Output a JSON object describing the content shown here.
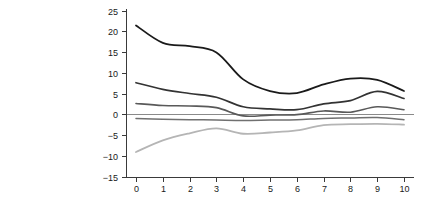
{
  "chart_data": {
    "type": "line",
    "title": "",
    "xlabel": "Number of years following portfolio formation",
    "ylabel": "ROIC − WACC (%)",
    "x": [
      0,
      1,
      2,
      3,
      4,
      5,
      6,
      7,
      8,
      9,
      10
    ],
    "xlim": [
      -0.55,
      10.6
    ],
    "ylim": [
      -15,
      25
    ],
    "xticks": [
      "0",
      "1",
      "2",
      "3",
      "4",
      "5",
      "6",
      "7",
      "8",
      "9",
      "10"
    ],
    "yticks": [
      "25",
      "20",
      "15",
      "10",
      "5",
      "0",
      "−5",
      "−10",
      "−15"
    ],
    "ytick_values": [
      25,
      20,
      15,
      10,
      5,
      0,
      -5,
      -10,
      -15
    ],
    "grid": false,
    "legend": "none",
    "reference_lines": [
      {
        "name": "zero-line",
        "y": 0,
        "color": "#8a8a8a"
      }
    ],
    "series": [
      {
        "name": "Top quintile",
        "color": "#1a1a1a",
        "width": 1.8,
        "values": [
          21.4,
          17.2,
          16.4,
          14.9,
          8.4,
          5.6,
          5.1,
          7.2,
          8.6,
          8.3,
          5.6
        ]
      },
      {
        "name": "Second quintile",
        "color": "#333333",
        "width": 1.7,
        "values": [
          7.6,
          6.0,
          5.0,
          4.1,
          1.8,
          1.3,
          1.1,
          2.5,
          3.3,
          5.5,
          3.8
        ]
      },
      {
        "name": "Third quintile",
        "color": "#595959",
        "width": 1.6,
        "values": [
          2.6,
          2.1,
          2.0,
          1.6,
          -0.4,
          -0.2,
          -0.1,
          0.8,
          0.5,
          1.8,
          1.1
        ]
      },
      {
        "name": "Fourth quintile",
        "color": "#707070",
        "width": 1.5,
        "values": [
          -1.0,
          -1.2,
          -1.3,
          -1.4,
          -1.5,
          -1.4,
          -1.3,
          -1.0,
          -0.9,
          -0.8,
          -1.3
        ]
      },
      {
        "name": "Bottom quintile",
        "color": "#b5b5b5",
        "width": 1.8,
        "values": [
          -9.1,
          -6.3,
          -4.6,
          -3.4,
          -4.7,
          -4.4,
          -3.9,
          -2.6,
          -2.4,
          -2.3,
          -2.5
        ]
      }
    ]
  },
  "axes": {
    "y_axis_name": "y-axis",
    "x_axis_name": "x-axis"
  }
}
